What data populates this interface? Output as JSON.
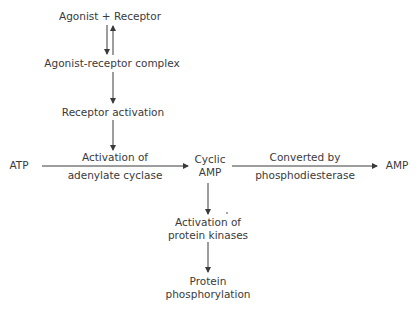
{
  "diagram": {
    "nodes": {
      "agonist_receptor": "Agonist + Receptor",
      "complex": "Agonist-receptor complex",
      "receptor_activation": "Receptor activation",
      "atp": "ATP",
      "cyclic_amp_line1": "Cyclic",
      "cyclic_amp_line2": "AMP",
      "amp": "AMP",
      "kinases_line1": "Activation of",
      "kinases_line2": "protein kinases",
      "phospho_line1": "Protein",
      "phospho_line2": "phosphorylation"
    },
    "edges": {
      "atp_to_camp_top": "Activation of",
      "atp_to_camp_bottom": "adenylate cyclase",
      "camp_to_amp_top": "Converted by",
      "camp_to_amp_bottom": "phosphodiesterase"
    },
    "colors": {
      "ink": "#3a3a3a"
    }
  }
}
